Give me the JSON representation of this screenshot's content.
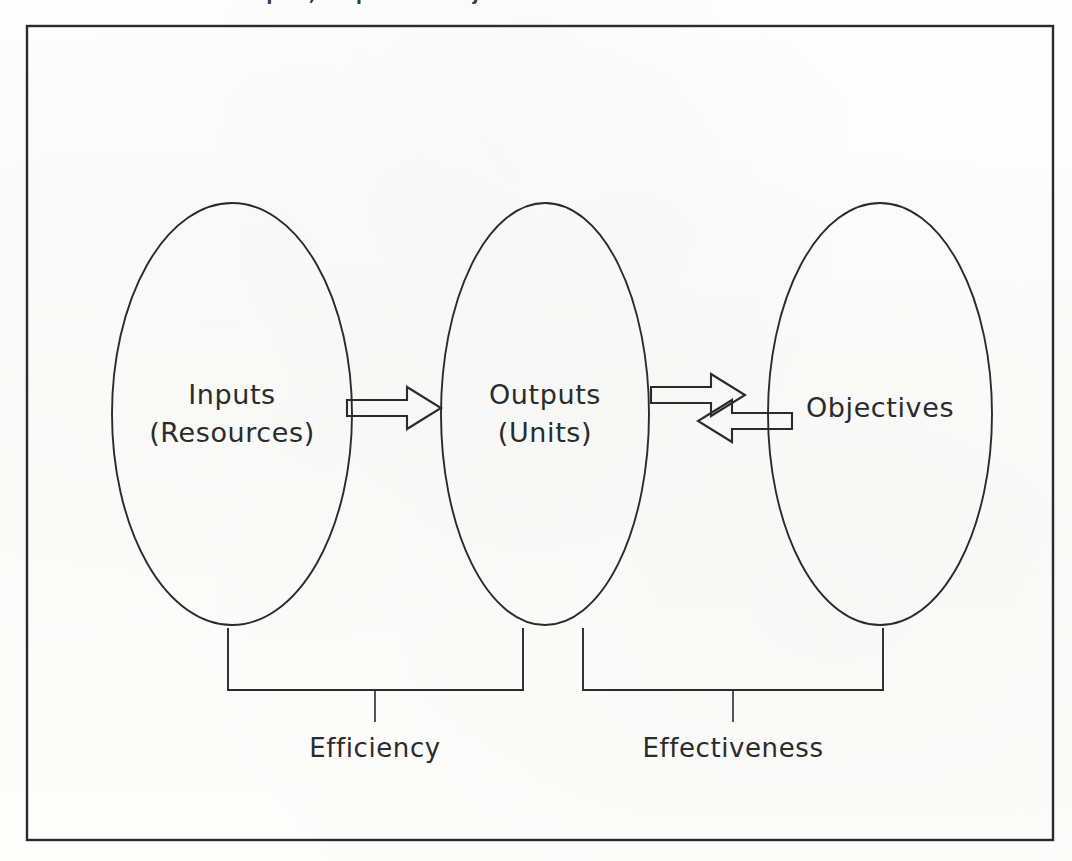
{
  "figure": {
    "kind": "process-diagram",
    "background_color": "#fdfdfc",
    "line_color": "#2b2b2b",
    "border": {
      "x": 27,
      "y": 26,
      "width": 1026,
      "height": 814
    },
    "top_bleed_text": "Inputs, Outputs and Objectives"
  },
  "nodes": [
    {
      "id": "inputs",
      "line1": "Inputs",
      "line2": "(Resources)",
      "cx": 232,
      "cy": 414,
      "rx": 120,
      "ry": 211
    },
    {
      "id": "outputs",
      "line1": "Outputs",
      "line2": "(Units)",
      "cx": 545,
      "cy": 414,
      "rx": 104,
      "ry": 211
    },
    {
      "id": "objectives",
      "line1": "Objectives",
      "line2": "",
      "cx": 880,
      "cy": 414,
      "rx": 112,
      "ry": 211
    }
  ],
  "arrows": [
    {
      "id": "inputs-to-outputs",
      "direction": "right",
      "from": "inputs",
      "to": "outputs",
      "x1": 347,
      "x2": 441,
      "y": 408
    },
    {
      "id": "outputs-to-objectives",
      "direction": "right",
      "from": "outputs",
      "to": "objectives",
      "x1": 651,
      "x2": 745,
      "y": 395
    },
    {
      "id": "objectives-to-outputs",
      "direction": "left",
      "from": "objectives",
      "to": "outputs",
      "x1": 698,
      "x2": 792,
      "y": 437
    }
  ],
  "brackets": [
    {
      "id": "efficiency",
      "label": "Efficiency",
      "left_x": 228,
      "right_x": 523,
      "top_y": 628,
      "bar_y": 690,
      "tick_x": 375,
      "tick_end_y": 722,
      "label_x": 375,
      "label_y": 735
    },
    {
      "id": "effectiveness",
      "label": "Effectiveness",
      "left_x": 583,
      "right_x": 883,
      "top_y": 628,
      "bar_y": 690,
      "tick_x": 733,
      "tick_end_y": 722,
      "label_x": 733,
      "label_y": 735
    }
  ]
}
